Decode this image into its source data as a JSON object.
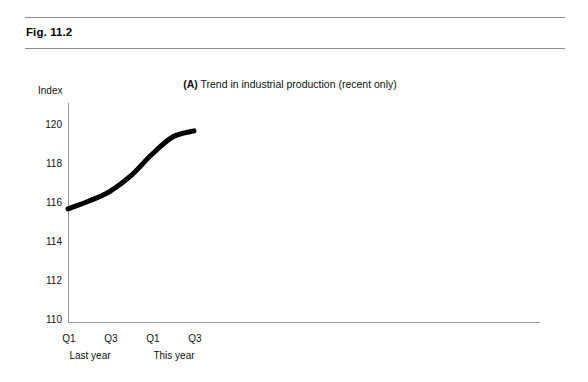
{
  "figure": {
    "label": "Fig. 11.2",
    "rule_color": "#8c8c8c"
  },
  "chart_data": {
    "type": "line",
    "title": "(A) Trend in industrial production (recent only)",
    "title_prefix": "(A)",
    "title_rest": " Trend in industrial production (recent only)",
    "xlabel": "",
    "ylabel": "Index",
    "ylim": [
      110,
      120.8
    ],
    "yticks": [
      110,
      112,
      114,
      116,
      118,
      120
    ],
    "ytick_labels": [
      "110",
      "112",
      "114",
      "116",
      "118",
      "120"
    ],
    "xticks": [
      "Q1",
      "Q3",
      "Q1",
      "Q3"
    ],
    "x_groups": [
      "Last year",
      "This year"
    ],
    "grid": false,
    "legend": null,
    "line_color": "#000000",
    "line_width": 5,
    "axis_color": "#9a9a9a",
    "series": [
      {
        "name": "Industrial production index",
        "x": [
          "Q1 last year",
          "Q2 last year",
          "Q3 last year",
          "Q4 last year",
          "Q1 this year",
          "Q2 this year",
          "Q3 this year"
        ],
        "values": [
          115.7,
          116.1,
          116.6,
          117.4,
          118.5,
          119.4,
          119.7
        ]
      }
    ]
  }
}
